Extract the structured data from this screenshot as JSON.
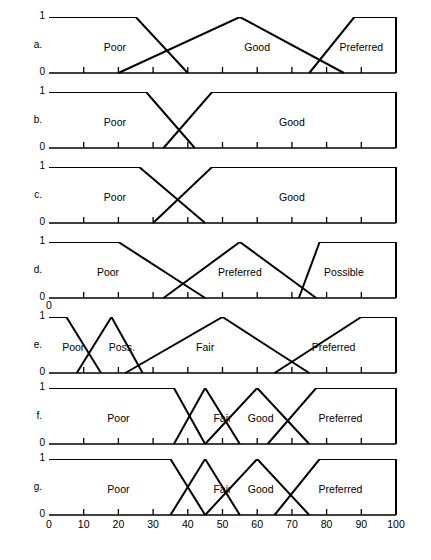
{
  "figure": {
    "title": "",
    "axis": {
      "x_min": 0,
      "x_max": 100,
      "x_ticks": [
        0,
        10,
        20,
        30,
        40,
        50,
        60,
        70,
        80,
        90,
        100
      ],
      "x_tick_labels": [
        "0",
        "10",
        "20",
        "30",
        "40",
        "50",
        "60",
        "70",
        "80",
        "90",
        "100"
      ],
      "y_min": 0,
      "y_max": 1,
      "y_tick_labels": [
        "0",
        "1"
      ],
      "extra_zero_label_under_panel_d": "0"
    },
    "panel_letters": [
      "a.",
      "b.",
      "c.",
      "d.",
      "e.",
      "f.",
      "g."
    ]
  },
  "chart_data": [
    {
      "type": "line",
      "id": "a",
      "title": "",
      "xlabel": "",
      "ylabel": "",
      "xlim": [
        0,
        100
      ],
      "ylim": [
        0,
        1
      ],
      "grid": false,
      "legend": "none",
      "series": [
        {
          "name": "Poor",
          "label": "Poor",
          "label_x": 19,
          "label_y": 0.45,
          "x": [
            0,
            25,
            40,
            40
          ],
          "y": [
            1,
            1,
            0,
            0
          ]
        },
        {
          "name": "Good",
          "label": "Good",
          "label_x": 60,
          "label_y": 0.45,
          "x": [
            20,
            55,
            85
          ],
          "y": [
            0,
            1,
            0
          ]
        },
        {
          "name": "Preferred",
          "label": "Preferred",
          "label_x": 90,
          "label_y": 0.45,
          "x": [
            75,
            88,
            100,
            100
          ],
          "y": [
            0,
            1,
            1,
            0
          ]
        }
      ]
    },
    {
      "type": "line",
      "id": "b",
      "title": "",
      "xlabel": "",
      "ylabel": "",
      "xlim": [
        0,
        100
      ],
      "ylim": [
        0,
        1
      ],
      "grid": false,
      "legend": "none",
      "series": [
        {
          "name": "Poor",
          "label": "Poor",
          "label_x": 19,
          "label_y": 0.45,
          "x": [
            0,
            28,
            42,
            42
          ],
          "y": [
            1,
            1,
            0,
            0
          ]
        },
        {
          "name": "Good",
          "label": "Good",
          "label_x": 70,
          "label_y": 0.45,
          "x": [
            33,
            47,
            100,
            100
          ],
          "y": [
            0,
            1,
            1,
            0
          ]
        }
      ]
    },
    {
      "type": "line",
      "id": "c",
      "title": "",
      "xlabel": "",
      "ylabel": "",
      "xlim": [
        0,
        100
      ],
      "ylim": [
        0,
        1
      ],
      "grid": false,
      "legend": "none",
      "series": [
        {
          "name": "Poor",
          "label": "Poor",
          "label_x": 19,
          "label_y": 0.45,
          "x": [
            0,
            26,
            45,
            45
          ],
          "y": [
            1,
            1,
            0,
            0
          ]
        },
        {
          "name": "Good",
          "label": "Good",
          "label_x": 70,
          "label_y": 0.45,
          "x": [
            30,
            47,
            100,
            100
          ],
          "y": [
            0,
            1,
            1,
            0
          ]
        }
      ]
    },
    {
      "type": "line",
      "id": "d",
      "title": "",
      "xlabel": "",
      "ylabel": "",
      "xlim": [
        0,
        100
      ],
      "ylim": [
        0,
        1
      ],
      "grid": false,
      "legend": "none",
      "series": [
        {
          "name": "Poor",
          "label": "Poor",
          "label_x": 17,
          "label_y": 0.45,
          "x": [
            0,
            20,
            45,
            45
          ],
          "y": [
            1,
            1,
            0,
            0
          ]
        },
        {
          "name": "Preferred",
          "label": "Preferred",
          "label_x": 55,
          "label_y": 0.45,
          "x": [
            33,
            55,
            77
          ],
          "y": [
            0,
            1,
            0
          ]
        },
        {
          "name": "Possible",
          "label": "Possible",
          "label_x": 85,
          "label_y": 0.45,
          "x": [
            72,
            78,
            100,
            100
          ],
          "y": [
            0,
            1,
            1,
            0
          ]
        }
      ]
    },
    {
      "type": "line",
      "id": "e",
      "title": "",
      "xlabel": "",
      "ylabel": "",
      "xlim": [
        0,
        100
      ],
      "ylim": [
        0,
        1
      ],
      "grid": false,
      "legend": "none",
      "series": [
        {
          "name": "Poor",
          "label": "Poor",
          "label_x": 7,
          "label_y": 0.45,
          "x": [
            0,
            5,
            15,
            15
          ],
          "y": [
            1,
            1,
            0,
            0
          ]
        },
        {
          "name": "Poss.",
          "label": "Poss.",
          "label_x": 21,
          "label_y": 0.45,
          "x": [
            8,
            18,
            27
          ],
          "y": [
            0,
            1,
            0
          ]
        },
        {
          "name": "Fair",
          "label": "Fair",
          "label_x": 45,
          "label_y": 0.45,
          "x": [
            22,
            50,
            75
          ],
          "y": [
            0,
            1,
            0
          ]
        },
        {
          "name": "Preferred",
          "label": "Preferred",
          "label_x": 82,
          "label_y": 0.45,
          "x": [
            65,
            90,
            100,
            100
          ],
          "y": [
            0,
            1,
            1,
            0
          ]
        }
      ]
    },
    {
      "type": "line",
      "id": "f",
      "title": "",
      "xlabel": "",
      "ylabel": "",
      "xlim": [
        0,
        100
      ],
      "ylim": [
        0,
        1
      ],
      "grid": false,
      "legend": "none",
      "series": [
        {
          "name": "Poor",
          "label": "Poor",
          "label_x": 20,
          "label_y": 0.45,
          "x": [
            0,
            36,
            45,
            45
          ],
          "y": [
            1,
            1,
            0,
            0
          ]
        },
        {
          "name": "Fair",
          "label": "Fair",
          "label_x": 50,
          "label_y": 0.45,
          "x": [
            36,
            45,
            55
          ],
          "y": [
            0,
            1,
            0
          ]
        },
        {
          "name": "Good",
          "label": "Good",
          "label_x": 61,
          "label_y": 0.45,
          "x": [
            45,
            60,
            75
          ],
          "y": [
            0,
            1,
            0
          ]
        },
        {
          "name": "Preferred",
          "label": "Preferred",
          "label_x": 84,
          "label_y": 0.45,
          "x": [
            63,
            77,
            100,
            100
          ],
          "y": [
            0,
            1,
            1,
            0
          ]
        }
      ]
    },
    {
      "type": "line",
      "id": "g",
      "title": "",
      "xlabel": "",
      "ylabel": "",
      "xlim": [
        0,
        100
      ],
      "ylim": [
        0,
        1
      ],
      "grid": false,
      "legend": "none",
      "series": [
        {
          "name": "Poor",
          "label": "Poor",
          "label_x": 20,
          "label_y": 0.45,
          "x": [
            0,
            35,
            45,
            45
          ],
          "y": [
            1,
            1,
            0,
            0
          ]
        },
        {
          "name": "Fair",
          "label": "Fair",
          "label_x": 50,
          "label_y": 0.45,
          "x": [
            35,
            45,
            55
          ],
          "y": [
            0,
            1,
            0
          ]
        },
        {
          "name": "Good",
          "label": "Good",
          "label_x": 61,
          "label_y": 0.45,
          "x": [
            45,
            60,
            75
          ],
          "y": [
            0,
            1,
            0
          ]
        },
        {
          "name": "Preferred",
          "label": "Preferred",
          "label_x": 84,
          "label_y": 0.45,
          "x": [
            65,
            78,
            100,
            100
          ],
          "y": [
            0,
            1,
            1,
            0
          ]
        }
      ]
    }
  ]
}
